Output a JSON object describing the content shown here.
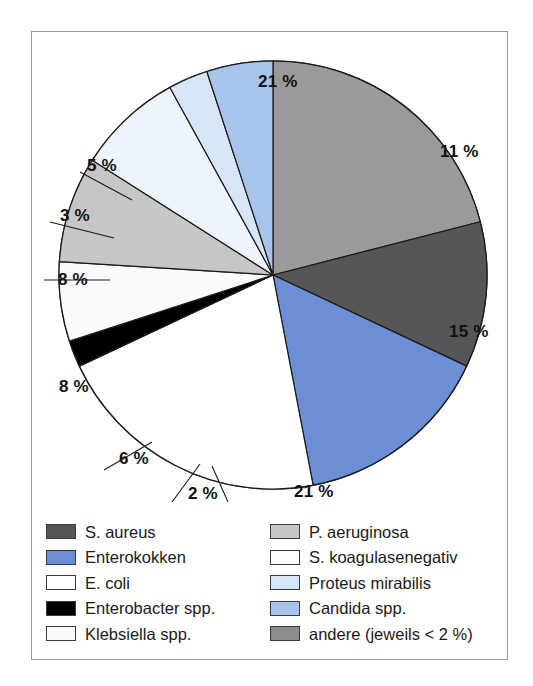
{
  "figure": {
    "type": "pie-chart-figure",
    "frame_border_color": "#9a9a9a",
    "background": "#ffffff"
  },
  "chart_data": {
    "type": "pie",
    "title": "",
    "xlabel": "",
    "ylabel": "",
    "unit": "%",
    "start_angle_deg": 0,
    "direction": "clockwise",
    "legend_position": "bottom",
    "grid": false,
    "total": 100,
    "categories": [
      "andere (jeweils < 2 %)",
      "S. aureus",
      "Enterokokken",
      "E. coli",
      "Enterobacter spp.",
      "Klebsiella spp.",
      "P. aeruginosa",
      "S. koagulasenegativ",
      "Proteus mirabilis",
      "Candida spp."
    ],
    "values": [
      21,
      11,
      15,
      21,
      2,
      6,
      8,
      8,
      3,
      5
    ],
    "labels": [
      "21 %",
      "11 %",
      "15 %",
      "21 %",
      "2 %",
      "6 %",
      "8 %",
      "8 %",
      "3 %",
      "5 %"
    ],
    "colors": [
      "#9a9a9a",
      "#565656",
      "#6b8ed4",
      "#ffffff",
      "#000000",
      "#fafafa",
      "#c6c6c6",
      "#eef4fb",
      "#d6e6f7",
      "#a8c4ea"
    ],
    "slices": [
      {
        "name": "andere (jeweils < 2 %)",
        "value": 21,
        "label": "21 %",
        "color": "#9a9a9a"
      },
      {
        "name": "S. aureus",
        "value": 11,
        "label": "11 %",
        "color": "#565656"
      },
      {
        "name": "Enterokokken",
        "value": 15,
        "label": "15 %",
        "color": "#6b8ed4"
      },
      {
        "name": "E. coli",
        "value": 21,
        "label": "21 %",
        "color": "#ffffff"
      },
      {
        "name": "Enterobacter spp.",
        "value": 2,
        "label": "2 %",
        "color": "#000000"
      },
      {
        "name": "Klebsiella spp.",
        "value": 6,
        "label": "6 %",
        "color": "#fafafa"
      },
      {
        "name": "P. aeruginosa",
        "value": 8,
        "label": "8 %",
        "color": "#c6c6c6"
      },
      {
        "name": "S. koagulasenegativ",
        "value": 8,
        "label": "8 %",
        "color": "#eef4fb"
      },
      {
        "name": "Proteus mirabilis",
        "value": 3,
        "label": "3 %",
        "color": "#d6e6f7"
      },
      {
        "name": "Candida spp.",
        "value": 5,
        "label": "5 %",
        "color": "#a8c4ea"
      }
    ]
  },
  "pie_labels": [
    {
      "text": "21 %",
      "x": 226,
      "y": 40
    },
    {
      "text": "11 %",
      "x": 408,
      "y": 110
    },
    {
      "text": "15 %",
      "x": 417,
      "y": 290
    },
    {
      "text": "21 %",
      "x": 262,
      "y": 450
    },
    {
      "text": "2 %",
      "x": 156,
      "y": 452
    },
    {
      "text": "6 %",
      "x": 87,
      "y": 417
    },
    {
      "text": "8 %",
      "x": 27,
      "y": 345
    },
    {
      "text": "8 %",
      "x": 26,
      "y": 238
    },
    {
      "text": "3 %",
      "x": 28,
      "y": 174
    },
    {
      "text": "5 %",
      "x": 55,
      "y": 124
    }
  ],
  "legend": {
    "left_column": [
      {
        "label": "S. aureus",
        "color": "#565656"
      },
      {
        "label": "Enterokokken",
        "color": "#6b8ed4"
      },
      {
        "label": "E. coli",
        "color": "#ffffff"
      },
      {
        "label": "Enterobacter spp.",
        "color": "#000000"
      },
      {
        "label": "Klebsiella spp.",
        "color": "#fafafa"
      }
    ],
    "right_column": [
      {
        "label": "P. aeruginosa",
        "color": "#c6c6c6"
      },
      {
        "label": "S. koagulasenegativ",
        "color": "#fdfdfd"
      },
      {
        "label": "Proteus mirabilis",
        "color": "#d6e6f7"
      },
      {
        "label": "Candida spp.",
        "color": "#a8c4ea"
      },
      {
        "label": "andere (jeweils < 2 %)",
        "color": "#8c8c8c"
      }
    ]
  }
}
